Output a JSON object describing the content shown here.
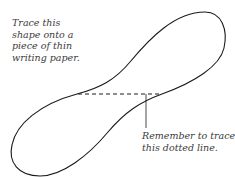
{
  "diagram": {
    "instruction_note": "Trace this\nshape onto a\npiece of thin\nwriting paper.",
    "dotted_line_note": "Remember to trace\nthis dotted line.",
    "shape": "figure-eight loop outline",
    "colors": {
      "outline": "#1a1a1a",
      "text": "#3a3a3a",
      "background": "#ffffff"
    }
  }
}
